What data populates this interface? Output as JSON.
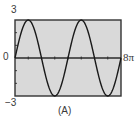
{
  "panel": {
    "caption": "(A)",
    "y_max_label": "3",
    "y_zero_label": "0",
    "y_min_label": "−3",
    "x_max_label": "8π"
  },
  "colors": {
    "plot_background": "#d9d9d9",
    "frame": "#333333",
    "curve": "#1a1a1a",
    "axis": "#2a2a2a"
  },
  "chart_data": {
    "type": "line",
    "title": "",
    "caption": "(A)",
    "xlabel": "",
    "ylabel": "",
    "xlim": [
      0,
      25.1327
    ],
    "ylim": [
      -3,
      3
    ],
    "x_tick_labels": [
      "0",
      "8π"
    ],
    "y_tick_labels": [
      "-3",
      "0",
      "3"
    ],
    "grid": false,
    "legend": null,
    "series": [
      {
        "name": "y = 3 sin(x/2)",
        "x": [
          0,
          3.1416,
          6.2832,
          9.4248,
          12.5664,
          15.708,
          18.8496,
          21.9911,
          25.1327
        ],
        "y": [
          0,
          3,
          0,
          -3,
          0,
          3,
          0,
          -3,
          0
        ]
      }
    ]
  }
}
